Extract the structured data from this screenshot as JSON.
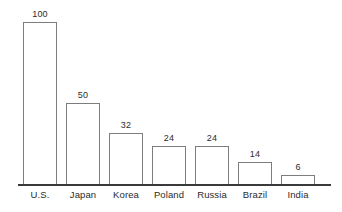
{
  "chart_data": {
    "type": "bar",
    "title": "",
    "subtitle": "",
    "xlabel": "",
    "ylabel": "",
    "categories": [
      "U.S.",
      "Japan",
      "Korea",
      "Poland",
      "Russia",
      "Brazil",
      "India"
    ],
    "values": [
      100,
      50,
      32,
      24,
      24,
      14,
      6
    ],
    "value_labels": [
      "100",
      "50",
      "32",
      "24",
      "24",
      "14",
      "6"
    ],
    "ylim": [
      0,
      100
    ],
    "grid": false,
    "legend": null,
    "legend_position": "none",
    "axis": {
      "x_axis_visible": true,
      "y_axis_visible": false,
      "tick_labels_y": [],
      "tick_labels_x": [
        "U.S.",
        "Japan",
        "Korea",
        "Poland",
        "Russia",
        "Brazil",
        "India"
      ]
    },
    "style": {
      "bar_fill": "#ffffff",
      "bar_stroke": "#7d7d7d",
      "axis_color": "#3a3a3a",
      "text_color": "#2b2b2b",
      "background": "#ffffff"
    }
  }
}
